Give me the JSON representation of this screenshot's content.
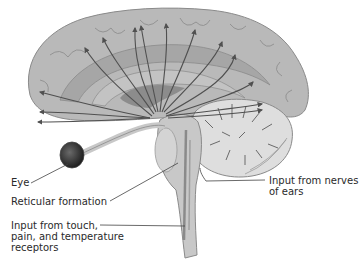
{
  "diagram": {
    "colors": {
      "background": "#ffffff",
      "brain_fill": "#b9b9b9",
      "cortex_fold": "#9a9a9a",
      "inner_band": "#a6a6a6",
      "thalamus": "#8c8c8c",
      "cerebellum": "#dedede",
      "brainstem": "#c8c8c8",
      "arrow": "#505050",
      "leader_line": "#444444",
      "text": "#2a2a2a"
    },
    "labels": {
      "eye": "Eye",
      "reticular_formation": "Reticular formation",
      "touch_line1": "Input from touch,",
      "touch_line2": "pain, and temperature",
      "touch_line3": "receptors",
      "ears_line1": "Input from nerves",
      "ears_line2": "of ears"
    },
    "structures": [
      "cerebrum",
      "thalamus",
      "cerebellum",
      "brainstem",
      "eye",
      "optic nerve",
      "reticular formation"
    ],
    "arrows": {
      "origin": "reticular formation / thalamus region",
      "count": 14,
      "direction": "radiating upward and outward to cerebral cortex"
    }
  }
}
